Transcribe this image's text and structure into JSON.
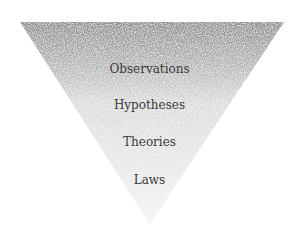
{
  "diagram": {
    "type": "inverted-triangle",
    "fill": {
      "top_color": "#8a8a8a",
      "bottom_color": "#f2f2f2",
      "texture": "stippled"
    },
    "levels": [
      {
        "label": "Observations",
        "y": 62
      },
      {
        "label": "Hypotheses",
        "y": 98
      },
      {
        "label": "Theories",
        "y": 135
      },
      {
        "label": "Laws",
        "y": 173
      }
    ]
  }
}
